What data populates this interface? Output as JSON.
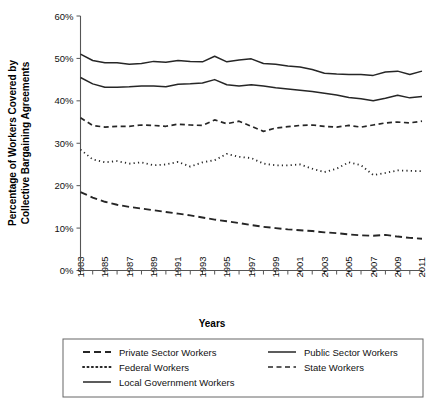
{
  "chart_data": {
    "type": "line",
    "title": "",
    "xlabel": "Years",
    "ylabel": "Percentage of Workers Covered by Collective Bargaining Agreements",
    "ylabel_lines": [
      "Percentage of Workers Covered by",
      "Collective Bargaining Agreements"
    ],
    "ylim": [
      0,
      60
    ],
    "ytick_values": [
      0,
      10,
      20,
      30,
      40,
      50,
      60
    ],
    "ytick_labels": [
      "0%",
      "10%",
      "20%",
      "30%",
      "40%",
      "50%",
      "60%"
    ],
    "xlim": [
      1983,
      2011
    ],
    "x": [
      1983,
      1984,
      1985,
      1986,
      1987,
      1988,
      1989,
      1990,
      1991,
      1992,
      1993,
      1994,
      1995,
      1996,
      1997,
      1998,
      1999,
      2000,
      2001,
      2002,
      2003,
      2004,
      2005,
      2006,
      2007,
      2008,
      2009,
      2010,
      2011
    ],
    "xtick_values": [
      1983,
      1984,
      1985,
      1986,
      1987,
      1988,
      1989,
      1990,
      1991,
      1992,
      1993,
      1994,
      1995,
      1996,
      1997,
      1998,
      1999,
      2000,
      2001,
      2002,
      2003,
      2004,
      2005,
      2006,
      2007,
      2008,
      2009,
      2010,
      2011
    ],
    "xtick_labels_shown": [
      "1983",
      "1985",
      "1987",
      "1989",
      "1991",
      "1993",
      "1995",
      "1997",
      "1999",
      "2001",
      "2003",
      "2005",
      "2007",
      "2009",
      "2011"
    ],
    "grid": false,
    "legend_position": "bottom",
    "legend_columns": 2,
    "series": [
      {
        "name": "Private Sector Workers",
        "style": "dashed",
        "dasharray": "7,4",
        "width": 1.9,
        "values": [
          18.5,
          17.2,
          16.2,
          15.5,
          15.0,
          14.6,
          14.2,
          13.8,
          13.4,
          13.0,
          12.5,
          12.0,
          11.6,
          11.2,
          10.7,
          10.3,
          10.0,
          9.7,
          9.5,
          9.3,
          9.0,
          8.8,
          8.5,
          8.3,
          8.2,
          8.4,
          8.0,
          7.7,
          7.5
        ]
      },
      {
        "name": "Public Sector Workers",
        "style": "solid",
        "dasharray": "",
        "width": 1.5,
        "values": [
          45.5,
          44.0,
          43.2,
          43.2,
          43.3,
          43.5,
          43.5,
          43.3,
          43.9,
          44.0,
          44.2,
          45.0,
          43.8,
          43.5,
          43.8,
          43.5,
          43.1,
          42.8,
          42.5,
          42.2,
          41.8,
          41.4,
          40.8,
          40.5,
          40.0,
          40.6,
          41.3,
          40.7,
          41.0
        ]
      },
      {
        "name": "Federal Workers",
        "style": "dotted",
        "dasharray": "1.2,3.2",
        "width": 1.8,
        "values": [
          28.5,
          26.2,
          25.5,
          25.8,
          25.2,
          25.5,
          24.8,
          25.0,
          25.6,
          24.5,
          25.5,
          26.0,
          27.5,
          26.8,
          26.5,
          25.2,
          24.8,
          24.8,
          25.0,
          24.0,
          23.2,
          24.0,
          25.5,
          24.8,
          22.5,
          23.0,
          23.6,
          23.5,
          23.4
        ]
      },
      {
        "name": "State Workers",
        "style": "dashed",
        "dasharray": "5,3.5",
        "width": 1.7,
        "values": [
          36.0,
          34.2,
          33.8,
          34.0,
          34.0,
          34.3,
          34.2,
          34.0,
          34.5,
          34.3,
          34.2,
          35.5,
          34.6,
          35.2,
          34.0,
          32.8,
          33.6,
          33.9,
          34.2,
          34.3,
          34.0,
          33.8,
          34.2,
          33.8,
          34.3,
          34.8,
          35.0,
          34.8,
          35.2
        ]
      },
      {
        "name": "Local Government Workers",
        "style": "solid",
        "dasharray": "",
        "width": 1.5,
        "values": [
          51.0,
          49.5,
          49.0,
          49.0,
          48.6,
          48.8,
          49.3,
          49.1,
          49.5,
          49.3,
          49.2,
          50.5,
          49.2,
          49.6,
          49.9,
          48.8,
          48.6,
          48.2,
          48.0,
          47.4,
          46.5,
          46.3,
          46.2,
          46.2,
          46.0,
          46.8,
          47.0,
          46.2,
          47.0
        ]
      }
    ],
    "legend_order": [
      0,
      1,
      2,
      3,
      4
    ],
    "legend_layout": [
      {
        "col": 0,
        "row": 0,
        "series_index": 0
      },
      {
        "col": 1,
        "row": 0,
        "series_index": 1
      },
      {
        "col": 0,
        "row": 1,
        "series_index": 2
      },
      {
        "col": 1,
        "row": 1,
        "series_index": 3
      },
      {
        "col": 0,
        "row": 2,
        "series_index": 4
      }
    ]
  },
  "colors": {
    "line": "#262626",
    "axis": "#555555",
    "text": "#111111",
    "background": "#ffffff"
  }
}
